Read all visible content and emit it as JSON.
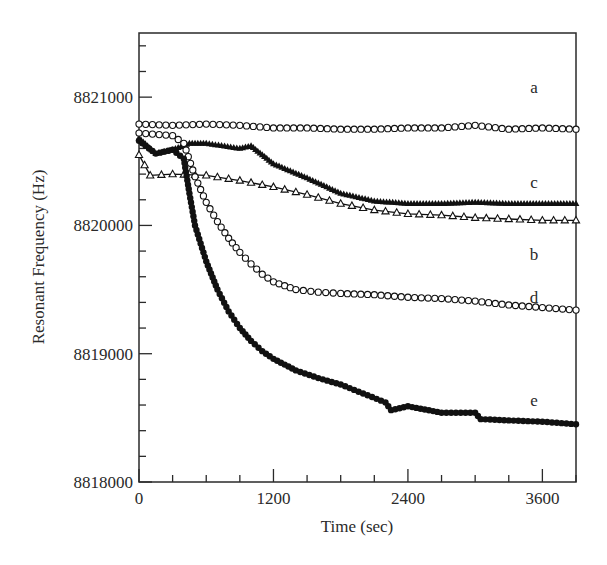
{
  "chart_data": {
    "type": "scatter",
    "title": "",
    "xlabel": "Time (sec)",
    "ylabel": "Resonant Frequency (Hz)",
    "xlim": [
      0,
      3900
    ],
    "ylim": [
      8818000,
      8821500
    ],
    "xticks": [
      0,
      1200,
      2400,
      3600
    ],
    "xtick_labels": [
      "0",
      "1200",
      "2400",
      "3600"
    ],
    "x_minor_step": 300,
    "yticks": [
      8818000,
      8819000,
      8820000,
      8821000
    ],
    "ytick_labels": [
      "8818000",
      "8819000",
      "8820000",
      "8821000"
    ],
    "y_minor_step": 200,
    "grid": false,
    "legend": "inline labels at right end of each curve",
    "series": [
      {
        "name": "a",
        "marker": "open-circle",
        "x": [
          0,
          300,
          600,
          900,
          1200,
          1500,
          1800,
          2100,
          2400,
          2700,
          3000,
          3300,
          3600,
          3900
        ],
        "y": [
          8820790,
          8820780,
          8820790,
          8820780,
          8820760,
          8820760,
          8820750,
          8820750,
          8820760,
          8820760,
          8820780,
          8820750,
          8820760,
          8820750
        ],
        "label_pos": [
          3560,
          8821080
        ]
      },
      {
        "name": "b",
        "marker": "open-triangle",
        "x": [
          0,
          100,
          300,
          600,
          900,
          1200,
          1500,
          1800,
          2100,
          2400,
          2700,
          3000,
          3300,
          3600,
          3900
        ],
        "y": [
          8820550,
          8820390,
          8820400,
          8820390,
          8820350,
          8820300,
          8820240,
          8820170,
          8820120,
          8820090,
          8820080,
          8820060,
          8820050,
          8820040,
          8820040
        ],
        "label_pos": [
          3560,
          8819780
        ]
      },
      {
        "name": "c",
        "marker": "filled-triangle",
        "x": [
          0,
          150,
          300,
          450,
          600,
          900,
          1000,
          1200,
          1500,
          1800,
          2100,
          2400,
          2700,
          3000,
          3300,
          3600,
          3900
        ],
        "y": [
          8820680,
          8820560,
          8820590,
          8820640,
          8820640,
          8820600,
          8820620,
          8820480,
          8820370,
          8820250,
          8820190,
          8820170,
          8820170,
          8820180,
          8820170,
          8820170,
          8820170
        ],
        "label_pos": [
          3560,
          8820340
        ]
      },
      {
        "name": "d",
        "marker": "open-circle",
        "x": [
          0,
          300,
          400,
          500,
          600,
          700,
          800,
          900,
          1000,
          1100,
          1200,
          1400,
          1600,
          1800,
          2100,
          2400,
          2700,
          3000,
          3300,
          3600,
          3900
        ],
        "y": [
          8820720,
          8820700,
          8820640,
          8820380,
          8820180,
          8820030,
          8819900,
          8819790,
          8819700,
          8819620,
          8819560,
          8819500,
          8819480,
          8819470,
          8819460,
          8819440,
          8819430,
          8819410,
          8819380,
          8819360,
          8819340
        ],
        "label_pos": [
          3560,
          8819440
        ]
      },
      {
        "name": "e",
        "marker": "filled-circle",
        "x": [
          0,
          150,
          300,
          400,
          450,
          500,
          600,
          700,
          800,
          900,
          1000,
          1100,
          1200,
          1400,
          1600,
          1800,
          2000,
          2200,
          2250,
          2400,
          2700,
          3000,
          3050,
          3300,
          3600,
          3900
        ],
        "y": [
          8820660,
          8820560,
          8820590,
          8820520,
          8820250,
          8820000,
          8819720,
          8819500,
          8819330,
          8819200,
          8819100,
          8819020,
          8818960,
          8818870,
          8818810,
          8818760,
          8818690,
          8818620,
          8818560,
          8818590,
          8818540,
          8818540,
          8818490,
          8818480,
          8818470,
          8818450
        ],
        "label_pos": [
          3560,
          8818640
        ]
      }
    ]
  },
  "colors": {
    "axis": "#2a2a2a",
    "series": "#111111",
    "background": "#ffffff"
  }
}
